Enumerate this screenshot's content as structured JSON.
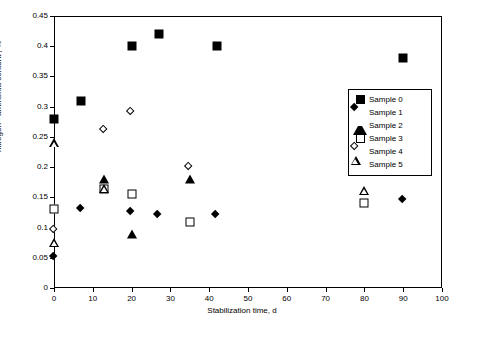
{
  "chart_data": {
    "type": "scatter",
    "title": "",
    "xlabel": "Stabilization time, d",
    "ylabel": "nitrogen - ammonia content , %",
    "xlim": [
      0,
      100
    ],
    "ylim": [
      0,
      0.45
    ],
    "grid": false,
    "legend_position": "right-inside",
    "xticks": [
      0,
      10,
      20,
      30,
      40,
      50,
      60,
      70,
      80,
      90,
      100
    ],
    "xtick_labels": [
      "0",
      "10",
      "20",
      "30",
      "40",
      "50",
      "60",
      "70",
      "80",
      "90",
      "100"
    ],
    "yticks": [
      0,
      0.05,
      0.1,
      0.15,
      0.2,
      0.25,
      0.3,
      0.35,
      0.4,
      0.45
    ],
    "ytick_labels": [
      "0",
      "0.05",
      "0.1",
      "0.15",
      "0.2",
      "0.25",
      "0.3",
      "0.35",
      "0.4",
      "0.45"
    ],
    "series": [
      {
        "name": "Sample 0",
        "marker": "square-filled",
        "points": [
          {
            "x": 0,
            "y": 0.28
          },
          {
            "x": 7,
            "y": 0.31
          },
          {
            "x": 20,
            "y": 0.4
          },
          {
            "x": 27,
            "y": 0.42
          },
          {
            "x": 42,
            "y": 0.4
          },
          {
            "x": 90,
            "y": 0.38
          }
        ]
      },
      {
        "name": "Sample 1",
        "marker": "diamond-filled",
        "points": [
          {
            "x": 0,
            "y": 0.05
          },
          {
            "x": 7,
            "y": 0.13
          },
          {
            "x": 20,
            "y": 0.125
          },
          {
            "x": 27,
            "y": 0.12
          },
          {
            "x": 42,
            "y": 0.12
          },
          {
            "x": 90,
            "y": 0.145
          }
        ]
      },
      {
        "name": "Sample 2",
        "marker": "triangle-filled",
        "points": [
          {
            "x": 13,
            "y": 0.18
          },
          {
            "x": 20,
            "y": 0.09
          },
          {
            "x": 35,
            "y": 0.18
          },
          {
            "x": 80,
            "y": 0.2
          }
        ]
      },
      {
        "name": "Sample 3",
        "marker": "square-open",
        "points": [
          {
            "x": 0,
            "y": 0.13
          },
          {
            "x": 13,
            "y": 0.163
          },
          {
            "x": 20,
            "y": 0.155
          },
          {
            "x": 35,
            "y": 0.11
          },
          {
            "x": 80,
            "y": 0.14
          }
        ]
      },
      {
        "name": "Sample 4",
        "marker": "diamond-open",
        "points": [
          {
            "x": 0,
            "y": 0.095
          },
          {
            "x": 13,
            "y": 0.26
          },
          {
            "x": 20,
            "y": 0.29
          },
          {
            "x": 35,
            "y": 0.2
          },
          {
            "x": 80,
            "y": 0.255
          }
        ]
      },
      {
        "name": "Sample 5",
        "marker": "triangle-open",
        "points": [
          {
            "x": 0,
            "y": 0.24
          },
          {
            "x": 0,
            "y": 0.075
          },
          {
            "x": 13,
            "y": 0.165
          },
          {
            "x": 80,
            "y": 0.162
          }
        ]
      }
    ]
  }
}
